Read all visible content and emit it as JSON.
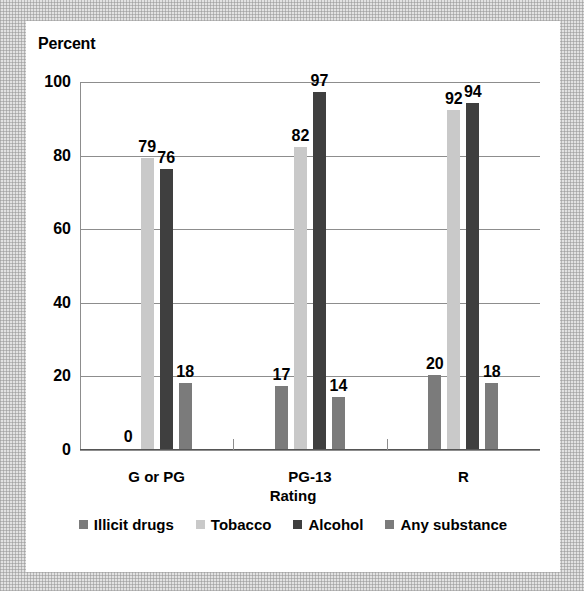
{
  "frame": {
    "border_color": "#e2e2e2",
    "card_color": "#ffffff"
  },
  "chart_data": {
    "type": "bar",
    "title": "Percent",
    "xlabel": "Rating",
    "ylabel": "Percent",
    "categories": [
      "G or PG",
      "PG-13",
      "R"
    ],
    "series": [
      {
        "name": "Illicit drugs",
        "values": [
          0,
          17,
          20
        ],
        "color": "#7b7b7b"
      },
      {
        "name": "Tobacco",
        "values": [
          79,
          82,
          92
        ],
        "color": "#c9c9c9"
      },
      {
        "name": "Alcohol",
        "values": [
          76,
          97,
          94
        ],
        "color": "#3f3f3f"
      },
      {
        "name": "Any substance",
        "values": [
          18,
          14,
          18
        ],
        "color": "#7b7b7b"
      }
    ],
    "ylim": [
      0,
      100
    ],
    "yticks": [
      0,
      20,
      40,
      60,
      80,
      100
    ],
    "ytick_labels": [
      "0",
      "20",
      "40",
      "60",
      "80",
      "100"
    ],
    "grid": true,
    "legend_position": "bottom",
    "data_labels": true
  },
  "legend": {
    "items": [
      {
        "label": "Illicit drugs",
        "color": "#7b7b7b"
      },
      {
        "label": "Tobacco",
        "color": "#c9c9c9"
      },
      {
        "label": "Alcohol",
        "color": "#3f3f3f"
      },
      {
        "label": "Any substance",
        "color": "#7b7b7b"
      }
    ]
  }
}
